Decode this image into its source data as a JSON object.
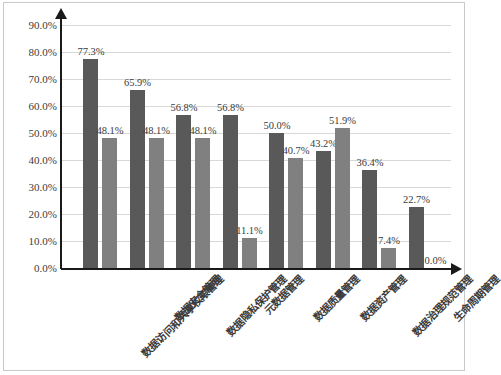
{
  "chart_data": {
    "type": "bar",
    "title": "",
    "subtitle": "",
    "xlabel": "",
    "ylabel": "",
    "ylim": [
      0,
      90
    ],
    "ytick_labels": [
      "90.0%",
      "80.0%",
      "70.0%",
      "60.0%",
      "50.0%",
      "40.0%",
      "30.0%",
      "20.0%",
      "10.0%",
      "0.0%"
    ],
    "ytick_values": [
      90,
      80,
      70,
      60,
      50,
      40,
      30,
      20,
      10,
      0
    ],
    "grid": true,
    "legend": "none",
    "categories": [
      "数据访问和共享权限管理",
      "数据安全管理",
      "数据隐私保护管理",
      "元数据管理",
      "数据质量管理",
      "数据资产管理",
      "数据治理规范管理",
      "生命周期管理"
    ],
    "series": [
      {
        "name": "series-1",
        "color": "#595959",
        "values": [
          77.3,
          65.9,
          56.8,
          56.8,
          50.0,
          43.2,
          36.4,
          22.7
        ],
        "labels": [
          "77.3%",
          "65.9%",
          "56.8%",
          "56.8%",
          "50.0%",
          "43.2%",
          "36.4%",
          "22.7%"
        ]
      },
      {
        "name": "series-2",
        "color": "#808080",
        "values": [
          48.1,
          48.1,
          48.1,
          11.1,
          40.7,
          51.9,
          7.4,
          0.0
        ],
        "labels": [
          "48.1%",
          "48.1%",
          "48.1%",
          "11.1%",
          "40.7%",
          "51.9%",
          "7.4%",
          "0.0%"
        ]
      }
    ]
  },
  "colors": {
    "series_1": "#595959",
    "series_2": "#808080",
    "axis": "#1a1a1a",
    "grid": "#d8d8d8",
    "frame_border": "#c9c9c9",
    "background": "#ffffff",
    "text": "#3b3b3b"
  }
}
